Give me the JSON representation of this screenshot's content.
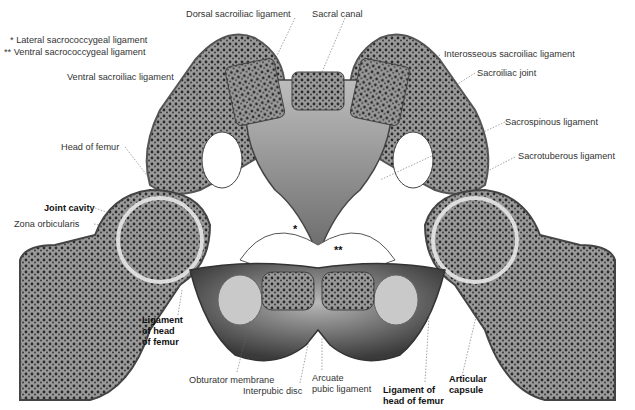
{
  "figure": {
    "legend": [
      {
        "marker": "*",
        "label": "Lateral sacrococcygeal ligament"
      },
      {
        "marker": "**",
        "label": "Ventral sacrococcygeal ligament"
      }
    ],
    "labels": {
      "dorsal_sacroiliac": "Dorsal sacroiliac ligament",
      "sacral_canal": "Sacral canal",
      "interosseous_sacroiliac": "Interosseous sacroiliac ligament",
      "sacroiliac_joint": "Sacroiliac joint",
      "ventral_sacroiliac": "Ventral sacroiliac ligament",
      "sacrospinous": "Sacrospinous ligament",
      "sacrotuberous": "Sacrotuberous ligament",
      "head_of_femur": "Head of femur",
      "joint_cavity": "Joint cavity",
      "zona_orbicularis": "Zona orbicularis",
      "lig_head_femur_left": "Ligament\nof head\nof femur",
      "obturator_membrane": "Obturator membrane",
      "interpubic_disc": "Interpubic disc",
      "arcuate_pubic": "Arcuate\npubic ligament",
      "lig_head_femur_right": "Ligament of\nhead of femur",
      "articular_capsule": "Articular\ncapsule",
      "star_single": "*",
      "star_double": "**"
    }
  }
}
